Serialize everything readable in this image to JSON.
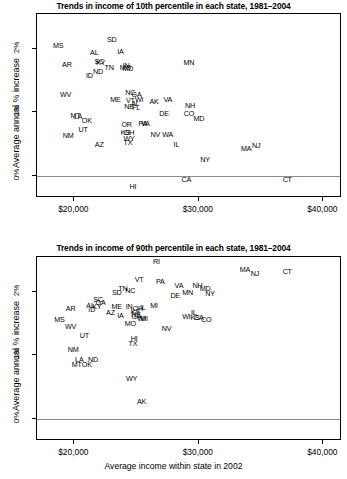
{
  "figure": {
    "xlabel": "Average income within state in 2002",
    "ylabel": "Average annual % increase",
    "xticks": [
      "$20,000",
      "$30,000",
      "$40,000"
    ],
    "xtick_values": [
      20000,
      30000,
      40000
    ],
    "yticks": [
      "0%",
      "1%",
      "2%"
    ],
    "ytick_values": [
      0,
      1,
      2
    ],
    "axis_color": "#000000",
    "zeroline_color": "#8a8a8a"
  },
  "chart_data": [
    {
      "type": "scatter",
      "title": "Trends in income of 10th percentile in each state, 1981–2004",
      "xlabel": "Average income within state in 2002",
      "ylabel": "Average annual % increase",
      "xlim": [
        17000,
        41500
      ],
      "ylim": [
        -0.35,
        2.55
      ],
      "grid": false,
      "legend": null,
      "marker_style": "state-abbreviation-text",
      "points": [
        {
          "label": "MS",
          "x": 18700,
          "y": 2.05
        },
        {
          "label": "SD",
          "x": 23000,
          "y": 2.14
        },
        {
          "label": "AL",
          "x": 21600,
          "y": 1.94
        },
        {
          "label": "IA",
          "x": 23700,
          "y": 1.95
        },
        {
          "label": "SC",
          "x": 22000,
          "y": 1.8
        },
        {
          "label": "KY",
          "x": 22100,
          "y": 1.78
        },
        {
          "label": "AR",
          "x": 19400,
          "y": 1.74
        },
        {
          "label": "MN",
          "x": 29200,
          "y": 1.78
        },
        {
          "label": "TN",
          "x": 22800,
          "y": 1.7
        },
        {
          "label": "MO",
          "x": 24100,
          "y": 1.7
        },
        {
          "label": "IN",
          "x": 24150,
          "y": 1.73
        },
        {
          "label": "MD",
          "x": 24300,
          "y": 1.68
        },
        {
          "label": "ND",
          "x": 21900,
          "y": 1.64
        },
        {
          "label": "ID",
          "x": 21200,
          "y": 1.58
        },
        {
          "label": "NC",
          "x": 24500,
          "y": 1.3
        },
        {
          "label": "GA",
          "x": 25000,
          "y": 1.28
        },
        {
          "label": "WV",
          "x": 19300,
          "y": 1.27
        },
        {
          "label": "ME",
          "x": 23300,
          "y": 1.19
        },
        {
          "label": "VT",
          "x": 24500,
          "y": 1.18
        },
        {
          "label": "WI",
          "x": 25200,
          "y": 1.19
        },
        {
          "label": "AL2",
          "x": 24900,
          "y": 1.13
        },
        {
          "label": "AK",
          "x": 26400,
          "y": 1.16
        },
        {
          "label": "VA",
          "x": 27500,
          "y": 1.19
        },
        {
          "label": "NE",
          "x": 24400,
          "y": 1.09
        },
        {
          "label": "FL",
          "x": 24950,
          "y": 1.07
        },
        {
          "label": "NH",
          "x": 29300,
          "y": 1.1
        },
        {
          "label": "MT",
          "x": 20100,
          "y": 0.94
        },
        {
          "label": "LA",
          "x": 20300,
          "y": 0.93
        },
        {
          "label": "CO",
          "x": 29200,
          "y": 0.98
        },
        {
          "label": "DE",
          "x": 27200,
          "y": 0.98
        },
        {
          "label": "OK",
          "x": 21000,
          "y": 0.86
        },
        {
          "label": "MD2",
          "x": 30000,
          "y": 0.9
        },
        {
          "label": "OR",
          "x": 24200,
          "y": 0.8
        },
        {
          "label": "PA",
          "x": 25500,
          "y": 0.82
        },
        {
          "label": "VA2",
          "x": 25700,
          "y": 0.82
        },
        {
          "label": "UT",
          "x": 20700,
          "y": 0.72
        },
        {
          "label": "KS",
          "x": 24100,
          "y": 0.68
        },
        {
          "label": "OH",
          "x": 24400,
          "y": 0.67
        },
        {
          "label": "NM",
          "x": 19500,
          "y": 0.62
        },
        {
          "label": "NV",
          "x": 26500,
          "y": 0.65
        },
        {
          "label": "WA",
          "x": 27500,
          "y": 0.65
        },
        {
          "label": "WY",
          "x": 24400,
          "y": 0.58
        },
        {
          "label": "TX",
          "x": 24300,
          "y": 0.52
        },
        {
          "label": "IL",
          "x": 28200,
          "y": 0.49
        },
        {
          "label": "AZ",
          "x": 22000,
          "y": 0.48
        },
        {
          "label": "MA",
          "x": 33800,
          "y": 0.42
        },
        {
          "label": "NJ",
          "x": 34600,
          "y": 0.47
        },
        {
          "label": "NY",
          "x": 30500,
          "y": 0.25
        },
        {
          "label": "CA",
          "x": 29000,
          "y": -0.07
        },
        {
          "label": "CT",
          "x": 37100,
          "y": -0.07
        },
        {
          "label": "HI",
          "x": 24700,
          "y": -0.17
        }
      ]
    },
    {
      "type": "scatter",
      "title": "Trends in income of 90th percentile in each state, 1981–2004",
      "xlabel": "Average income within state in 2002",
      "ylabel": "Average annual % increase",
      "xlim": [
        17000,
        41500
      ],
      "ylim": [
        -0.35,
        2.55
      ],
      "grid": false,
      "legend": null,
      "marker_style": "state-abbreviation-text",
      "points": [
        {
          "label": "RI",
          "x": 26600,
          "y": 2.47
        },
        {
          "label": "MA",
          "x": 33700,
          "y": 2.35
        },
        {
          "label": "NJ",
          "x": 34500,
          "y": 2.28
        },
        {
          "label": "CT",
          "x": 37100,
          "y": 2.32
        },
        {
          "label": "VT",
          "x": 25200,
          "y": 2.18
        },
        {
          "label": "PA",
          "x": 26900,
          "y": 2.16
        },
        {
          "label": "VA",
          "x": 28400,
          "y": 2.1
        },
        {
          "label": "NH",
          "x": 29900,
          "y": 2.09
        },
        {
          "label": "MD",
          "x": 30500,
          "y": 2.05
        },
        {
          "label": "TN",
          "x": 23900,
          "y": 2.04
        },
        {
          "label": "NC",
          "x": 24500,
          "y": 2.01
        },
        {
          "label": "SD",
          "x": 23400,
          "y": 1.99
        },
        {
          "label": "MN",
          "x": 29100,
          "y": 1.98
        },
        {
          "label": "DE",
          "x": 28100,
          "y": 1.94
        },
        {
          "label": "NY",
          "x": 30900,
          "y": 1.96
        },
        {
          "label": "SC",
          "x": 21900,
          "y": 1.87
        },
        {
          "label": "GA",
          "x": 22100,
          "y": 1.82
        },
        {
          "label": "AL",
          "x": 21300,
          "y": 1.78
        },
        {
          "label": "KY",
          "x": 21800,
          "y": 1.76
        },
        {
          "label": "ME",
          "x": 23400,
          "y": 1.76
        },
        {
          "label": "IN",
          "x": 24400,
          "y": 1.76
        },
        {
          "label": "OH",
          "x": 25100,
          "y": 1.73
        },
        {
          "label": "IL",
          "x": 25500,
          "y": 1.74
        },
        {
          "label": "MI",
          "x": 26400,
          "y": 1.77
        },
        {
          "label": "AR",
          "x": 19700,
          "y": 1.73
        },
        {
          "label": "ID",
          "x": 21400,
          "y": 1.71
        },
        {
          "label": "AZ",
          "x": 22900,
          "y": 1.66
        },
        {
          "label": "IA",
          "x": 23700,
          "y": 1.62
        },
        {
          "label": "KS",
          "x": 24900,
          "y": 1.68
        },
        {
          "label": "NE",
          "x": 24950,
          "y": 1.64
        },
        {
          "label": "GA2",
          "x": 25000,
          "y": 1.6
        },
        {
          "label": "WI",
          "x": 25400,
          "y": 1.58
        },
        {
          "label": "MI2",
          "x": 25600,
          "y": 1.58
        },
        {
          "label": "IL2",
          "x": 29600,
          "y": 1.66
        },
        {
          "label": "WI3",
          "x": 29000,
          "y": 1.6
        },
        {
          "label": "KS2",
          "x": 29700,
          "y": 1.59
        },
        {
          "label": "CA",
          "x": 30000,
          "y": 1.59
        },
        {
          "label": "CO",
          "x": 30600,
          "y": 1.56
        },
        {
          "label": "MS",
          "x": 18800,
          "y": 1.56
        },
        {
          "label": "MO",
          "x": 24500,
          "y": 1.49
        },
        {
          "label": "WV",
          "x": 19700,
          "y": 1.44
        },
        {
          "label": "NV",
          "x": 27400,
          "y": 1.42
        },
        {
          "label": "UT",
          "x": 20800,
          "y": 1.3
        },
        {
          "label": "HI",
          "x": 24800,
          "y": 1.26
        },
        {
          "label": "TX",
          "x": 24700,
          "y": 1.18
        },
        {
          "label": "NM",
          "x": 19900,
          "y": 1.08
        },
        {
          "label": "LA",
          "x": 20400,
          "y": 0.92
        },
        {
          "label": "ND",
          "x": 21500,
          "y": 0.93
        },
        {
          "label": "MT",
          "x": 20200,
          "y": 0.85
        },
        {
          "label": "OK",
          "x": 21000,
          "y": 0.84
        },
        {
          "label": "WY",
          "x": 24600,
          "y": 0.62
        },
        {
          "label": "AK",
          "x": 25400,
          "y": 0.26
        }
      ]
    }
  ]
}
